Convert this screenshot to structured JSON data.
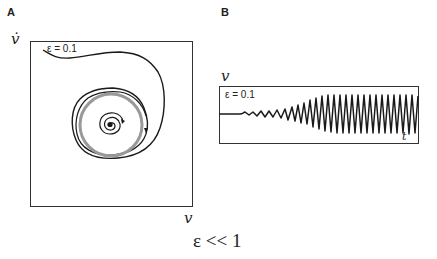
{
  "panel_a": {
    "label": "A",
    "y_axis_label": "v̇",
    "x_axis_label": "v",
    "epsilon_label": "ε = 0.1",
    "description": "Phase portrait: trajectories spiral outward from unstable fixed point and inward from outside, converging onto a gray limit cycle"
  },
  "panel_b": {
    "label": "B",
    "y_axis_label": "v",
    "x_axis_label": "t",
    "epsilon_label": "ε = 0.1",
    "description": "Time series: oscillation grows from flat line to sustained large-amplitude oscillation"
  },
  "caption": "ε << 1",
  "colors": {
    "trajectory": "#1a1a1a",
    "limit_cycle": "#999999",
    "frame": "#333333"
  }
}
